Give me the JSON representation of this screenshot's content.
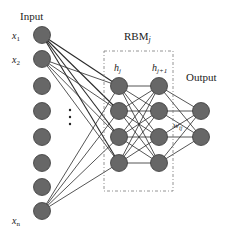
{
  "labels": {
    "input": "Input",
    "output": "Output",
    "rbm": "RBM",
    "rbm_sub": "j",
    "h_j": "h",
    "h_j_sub": "j",
    "h_j1": "h",
    "h_j1_sub": "j+1",
    "weight": "w",
    "weight_sub": "ij",
    "ellipsis": "⋮"
  },
  "input_labels": [
    {
      "main": "x",
      "sub": "1"
    },
    {
      "main": "x",
      "sub": "2"
    },
    {
      "main": "x",
      "sub": "n"
    }
  ],
  "layers": {
    "input": {
      "count": 8,
      "x": 42,
      "y": [
        35,
        59,
        86,
        111,
        137,
        163,
        187,
        211
      ]
    },
    "hidden_j": {
      "count": 4,
      "x": 119,
      "y": [
        86,
        111,
        137,
        163
      ]
    },
    "hidden_j1": {
      "count": 4,
      "x": 159,
      "y": [
        86,
        111,
        137,
        163
      ]
    },
    "output": {
      "count": 2,
      "x": 201,
      "y": [
        111,
        137
      ]
    }
  },
  "connected_input_indices": [
    0,
    1,
    7
  ],
  "colors": {
    "node_fill": "#676767",
    "node_stroke": "#3a3a3a",
    "edge": "#2a2a2a",
    "box": "#7a7a7a"
  }
}
